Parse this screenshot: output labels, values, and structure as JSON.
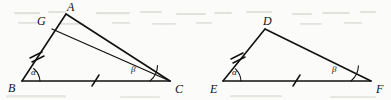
{
  "figure": {
    "background_color": "#fbfbf9",
    "ink_color": "#111111",
    "width": 391,
    "height": 100
  },
  "left_figure": {
    "name": "triangle-abc-with-cevian",
    "vertices": [
      {
        "id": "B",
        "label": "B",
        "x": 22,
        "y": 81
      },
      {
        "id": "C",
        "label": "C",
        "x": 170,
        "y": 81
      },
      {
        "id": "A",
        "label": "A",
        "x": 66,
        "y": 14
      },
      {
        "id": "G",
        "label": "G",
        "x": 52,
        "y": 29
      }
    ],
    "vertex_labels": [
      {
        "text": "B",
        "x": 8,
        "y": 92
      },
      {
        "text": "C",
        "x": 175,
        "y": 93
      },
      {
        "text": "A",
        "x": 67,
        "y": 11
      },
      {
        "text": "G",
        "x": 37,
        "y": 25
      }
    ],
    "segments": [
      {
        "from": "B",
        "to": "A",
        "name": "side-ba"
      },
      {
        "from": "B",
        "to": "C",
        "name": "side-bc"
      },
      {
        "from": "A",
        "to": "C",
        "name": "side-ac"
      },
      {
        "from": "G",
        "to": "C",
        "name": "cevian-gc"
      }
    ],
    "tick_marks": [
      {
        "on": "segment-bg",
        "count": 2,
        "name": "double-tick-bg"
      },
      {
        "on": "segment-bc",
        "count": 1,
        "name": "single-tick-bc"
      }
    ],
    "angles": [
      {
        "label": "α",
        "at": "B",
        "name": "angle-alpha-at-b",
        "label_x": 31,
        "label_y": 75
      },
      {
        "label": "β",
        "at": "C",
        "name": "angle-beta-at-c",
        "label_x": 131,
        "label_y": 72
      }
    ]
  },
  "right_figure": {
    "name": "triangle-def",
    "vertices": [
      {
        "id": "E",
        "label": "E",
        "x": 223,
        "y": 81
      },
      {
        "id": "F",
        "label": "F",
        "x": 371,
        "y": 81
      },
      {
        "id": "D",
        "label": "D",
        "x": 265,
        "y": 29
      }
    ],
    "vertex_labels": [
      {
        "text": "E",
        "x": 210,
        "y": 93
      },
      {
        "text": "F",
        "x": 376,
        "y": 93
      },
      {
        "text": "D",
        "x": 263,
        "y": 25
      }
    ],
    "segments": [
      {
        "from": "E",
        "to": "D",
        "name": "side-ed"
      },
      {
        "from": "E",
        "to": "F",
        "name": "side-ef"
      },
      {
        "from": "D",
        "to": "F",
        "name": "side-df"
      }
    ],
    "tick_marks": [
      {
        "on": "segment-ed",
        "count": 2,
        "name": "double-tick-ed"
      },
      {
        "on": "segment-ef",
        "count": 1,
        "name": "single-tick-ef"
      }
    ],
    "angles": [
      {
        "label": "α",
        "at": "E",
        "name": "angle-alpha-at-e",
        "label_x": 232,
        "label_y": 75
      },
      {
        "label": "β",
        "at": "F",
        "name": "angle-beta-at-f",
        "label_x": 332,
        "label_y": 72
      }
    ]
  }
}
